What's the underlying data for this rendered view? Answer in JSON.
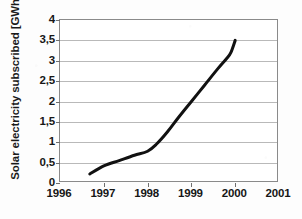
{
  "chart_data": {
    "type": "line",
    "title": "",
    "xlabel": "",
    "ylabel": "Solar electricity subscribed [GWh]",
    "xlim": [
      1996,
      2001
    ],
    "ylim": [
      0,
      4
    ],
    "grid": true,
    "legend": "none",
    "decimal_separator": ",",
    "x_tick_labels": [
      "1996",
      "1997",
      "1998",
      "1999",
      "2000",
      "2001"
    ],
    "x_ticks": [
      1996,
      1997,
      1998,
      1999,
      2000,
      2001
    ],
    "y_tick_labels": [
      "0",
      "0,5",
      "1",
      "1,5",
      "2",
      "2,5",
      "3",
      "3,5",
      "4"
    ],
    "y_ticks": [
      0,
      0.5,
      1,
      1.5,
      2,
      2.5,
      3,
      3.5,
      4
    ],
    "series": [
      {
        "name": "Solar electricity subscribed",
        "color": "#111111",
        "line_width": 3,
        "x": [
          1996.68,
          1997.0,
          1997.35,
          1997.7,
          1998.0,
          1998.2,
          1998.45,
          1998.7,
          1999.0,
          1999.3,
          1999.6,
          1999.8,
          1999.9,
          2000.0
        ],
        "values": [
          0.22,
          0.42,
          0.55,
          0.68,
          0.78,
          0.95,
          1.25,
          1.6,
          2.0,
          2.4,
          2.8,
          3.05,
          3.2,
          3.5
        ]
      }
    ]
  },
  "axis": {
    "y_title": "Solar electricity subscribed [GWh]"
  }
}
